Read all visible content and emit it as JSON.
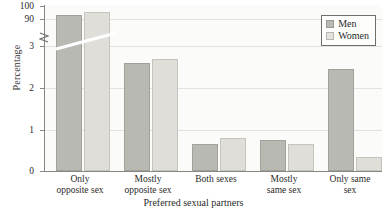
{
  "chart_data": {
    "type": "bar",
    "title": "",
    "xlabel": "Preferred sexual partners",
    "ylabel": "Percentage",
    "categories": [
      "Only\nopposite sex",
      "Mostly\nopposite sex",
      "Both sexes",
      "Mostly\nsame sex",
      "Only same\nsex"
    ],
    "category_lines": [
      [
        "Only",
        "opposite sex"
      ],
      [
        "Mostly",
        "opposite sex"
      ],
      [
        "Both sexes",
        ""
      ],
      [
        "Mostly",
        "same sex"
      ],
      [
        "Only same",
        "sex"
      ]
    ],
    "series": [
      {
        "name": "Men",
        "color": "#b9b9b3",
        "values": [
          93.1,
          2.6,
          0.65,
          0.75,
          2.45
        ]
      },
      {
        "name": "Women",
        "color": "#e0ded8",
        "values": [
          95.6,
          2.7,
          0.8,
          0.65,
          0.33
        ]
      }
    ],
    "legend": {
      "position": "top-right",
      "entries": [
        "Men",
        "Women"
      ]
    },
    "grid": true,
    "axis_break": {
      "present": true,
      "below": 3,
      "above": 90
    },
    "yticks_upper": [
      "100",
      "90"
    ],
    "yticks_lower": [
      "3",
      "2",
      "1",
      "0"
    ],
    "ylim_lower": [
      0,
      3
    ],
    "ylim_upper": [
      90,
      100
    ]
  },
  "legend": {
    "men_label": "Men",
    "women_label": "Women"
  },
  "axis": {
    "y_title": "Percentage",
    "x_title": "Preferred sexual partners",
    "tick_100": "100",
    "tick_90": "90",
    "tick_3": "3",
    "tick_2": "2",
    "tick_1": "1",
    "tick_0": "0"
  },
  "categories": {
    "c0_line1": "Only",
    "c0_line2": "opposite sex",
    "c1_line1": "Mostly",
    "c1_line2": "opposite sex",
    "c2_line1": "Both sexes",
    "c2_line2": "",
    "c3_line1": "Mostly",
    "c3_line2": "same sex",
    "c4_line1": "Only same",
    "c4_line2": "sex"
  }
}
